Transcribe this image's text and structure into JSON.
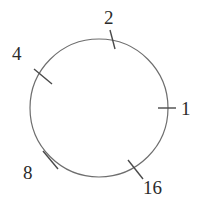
{
  "figure": {
    "type": "circle-tick-diagram",
    "width": 206,
    "height": 210,
    "background_color": "#ffffff",
    "stroke_color": "#6e6e6e",
    "text_color": "#2b2b2b",
    "circle": {
      "center_x": 99,
      "center_y": 108,
      "radius": 69,
      "stroke_width": 1.2
    }
  },
  "chart_data": {
    "type": "scatter",
    "title": "",
    "xlabel": "",
    "ylabel": "",
    "categories": [
      "1",
      "2",
      "4",
      "8",
      "16"
    ],
    "values": [
      1,
      2,
      4,
      8,
      16
    ],
    "angles_deg": [
      0,
      77,
      155,
      215,
      304
    ],
    "grid": false,
    "legend": null
  },
  "marks": [
    {
      "label": "1",
      "angle_deg": 0,
      "label_x": 181,
      "label_y": 99,
      "tick_x1": 158,
      "tick_y1": 108,
      "tick_x2": 176,
      "tick_y2": 108
    },
    {
      "label": "2",
      "angle_deg": 77,
      "label_x": 104,
      "label_y": 8,
      "tick_x1": 110,
      "tick_y1": 30,
      "tick_x2": 115,
      "tick_y2": 49
    },
    {
      "label": "4",
      "angle_deg": 155,
      "label_x": 12,
      "label_y": 44,
      "tick_x1": 34,
      "tick_y1": 69,
      "tick_x2": 52,
      "tick_y2": 84
    },
    {
      "label": "8",
      "angle_deg": 215,
      "label_x": 23,
      "label_y": 163,
      "tick_x1": 43,
      "tick_y1": 151,
      "tick_x2": 58,
      "tick_y2": 169
    },
    {
      "label": "16",
      "angle_deg": 304,
      "label_x": 143,
      "label_y": 178,
      "tick_x1": 128,
      "tick_y1": 160,
      "tick_x2": 143,
      "tick_y2": 179
    }
  ]
}
